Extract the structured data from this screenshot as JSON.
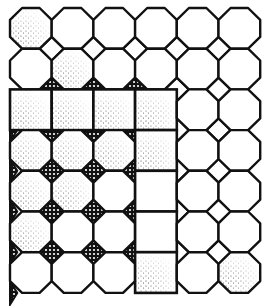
{
  "illustration": {
    "subject": "tile floor pattern",
    "width": 268,
    "height": 306,
    "grid": {
      "cols": 6,
      "rows": 7,
      "x0": 10,
      "y0": 8,
      "pitch_x": 41.7,
      "pitch_y": 40.7
    },
    "colors": {
      "ink": "#111111",
      "paper": "#ffffff"
    },
    "cells": [
      [
        "oct",
        "oct",
        "oct",
        "oct",
        "oct",
        "oct"
      ],
      [
        "oct",
        "oct",
        "oct",
        "oct",
        "oct",
        "oct"
      ],
      [
        "sq",
        "sq",
        "sq",
        "sq",
        "oct",
        "oct"
      ],
      [
        "oct",
        "oct",
        "oct",
        "sq",
        "oct",
        "oct"
      ],
      [
        "oct",
        "oct",
        "oct",
        "sq",
        "oct",
        "oct"
      ],
      [
        "oct",
        "oct",
        "oct",
        "sq",
        "oct",
        "oct"
      ],
      [
        "oct",
        "oct",
        "oct",
        "sq",
        "oct",
        "oct"
      ]
    ],
    "stippled_cells": [
      [
        0,
        0
      ],
      [
        1,
        1
      ],
      [
        2,
        0
      ],
      [
        2,
        1
      ],
      [
        2,
        2
      ],
      [
        2,
        3
      ],
      [
        3,
        0
      ],
      [
        3,
        1
      ],
      [
        3,
        2
      ],
      [
        3,
        3
      ],
      [
        4,
        0
      ],
      [
        4,
        1
      ],
      [
        5,
        0
      ],
      [
        6,
        3
      ],
      [
        6,
        5
      ]
    ],
    "crosshatched_diamond_rows": [
      3,
      4,
      5,
      6,
      7
    ],
    "crosshatched_diamond_max_col": 3
  }
}
